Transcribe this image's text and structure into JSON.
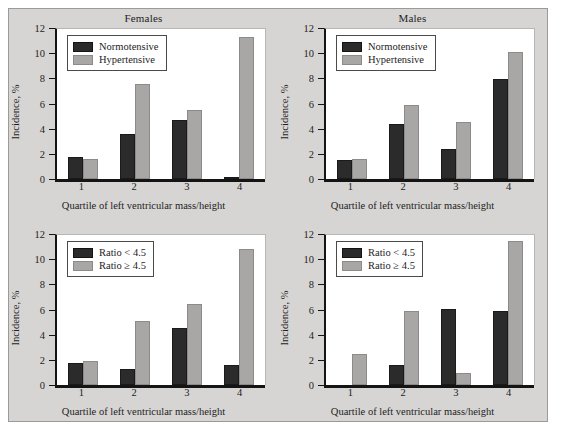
{
  "figure": {
    "panel_background": "#d7d5d3",
    "page_background": "#ffffff",
    "border_color": "#9b9a98"
  },
  "style": {
    "dark_color": "#2b2b2b",
    "light_color": "#a9a7a5",
    "axis_color": "#141414",
    "plot_background": "#ffffff"
  },
  "axes": {
    "y_title": "Incidence, %",
    "x_title": "Quartile of left ventricular mass/height",
    "y_ticks": [
      "0",
      "2",
      "4",
      "6",
      "8",
      "10",
      "12"
    ],
    "x_ticks": [
      "1",
      "2",
      "3",
      "4"
    ]
  },
  "chart_data": [
    {
      "id": "females-normotensive-hypertensive",
      "type": "bar",
      "title": "Females",
      "xlabel": "Quartile of left ventricular mass/height",
      "ylabel": "Incidence, %",
      "ylim": [
        0,
        12
      ],
      "ytick_step": 2,
      "grid": false,
      "legend_position": "top-left",
      "categories": [
        "1",
        "2",
        "3",
        "4"
      ],
      "series": [
        {
          "name": "Normotensive",
          "color": "#2b2b2b",
          "values": [
            1.8,
            3.6,
            4.7,
            0.1
          ]
        },
        {
          "name": "Hypertensive",
          "color": "#a9a7a5",
          "values": [
            1.6,
            7.6,
            5.5,
            11.4
          ]
        }
      ]
    },
    {
      "id": "males-normotensive-hypertensive",
      "type": "bar",
      "title": "Males",
      "xlabel": "Quartile of left ventricular mass/height",
      "ylabel": "Incidence, %",
      "ylim": [
        0,
        12
      ],
      "ytick_step": 2,
      "grid": false,
      "legend_position": "top-left",
      "categories": [
        "1",
        "2",
        "3",
        "4"
      ],
      "series": [
        {
          "name": "Normotensive",
          "color": "#2b2b2b",
          "values": [
            1.5,
            4.4,
            2.4,
            8.0
          ]
        },
        {
          "name": "Hypertensive",
          "color": "#a9a7a5",
          "values": [
            1.6,
            5.9,
            4.6,
            10.2
          ]
        }
      ]
    },
    {
      "id": "females-ratio",
      "type": "bar",
      "title": "",
      "xlabel": "Quartile of left ventricular mass/height",
      "ylabel": "Incidence, %",
      "ylim": [
        0,
        12
      ],
      "ytick_step": 2,
      "grid": false,
      "legend_position": "top-left",
      "categories": [
        "1",
        "2",
        "3",
        "4"
      ],
      "series": [
        {
          "name": "Ratio < 4.5",
          "color": "#2b2b2b",
          "values": [
            1.8,
            1.3,
            4.6,
            1.6
          ]
        },
        {
          "name": "Ratio ≥ 4.5",
          "color": "#a9a7a5",
          "values": [
            1.9,
            5.1,
            6.5,
            10.9
          ]
        }
      ]
    },
    {
      "id": "males-ratio",
      "type": "bar",
      "title": "",
      "xlabel": "Quartile of left ventricular mass/height",
      "ylabel": "Incidence, %",
      "ylim": [
        0,
        12
      ],
      "ytick_step": 2,
      "grid": false,
      "legend_position": "top-left",
      "categories": [
        "1",
        "2",
        "3",
        "4"
      ],
      "series": [
        {
          "name": "Ratio < 4.5",
          "color": "#2b2b2b",
          "values": [
            0.0,
            1.6,
            6.1,
            5.9
          ]
        },
        {
          "name": "Ratio ≥ 4.5",
          "color": "#a9a7a5",
          "values": [
            2.5,
            5.9,
            1.0,
            11.5
          ]
        }
      ]
    }
  ]
}
